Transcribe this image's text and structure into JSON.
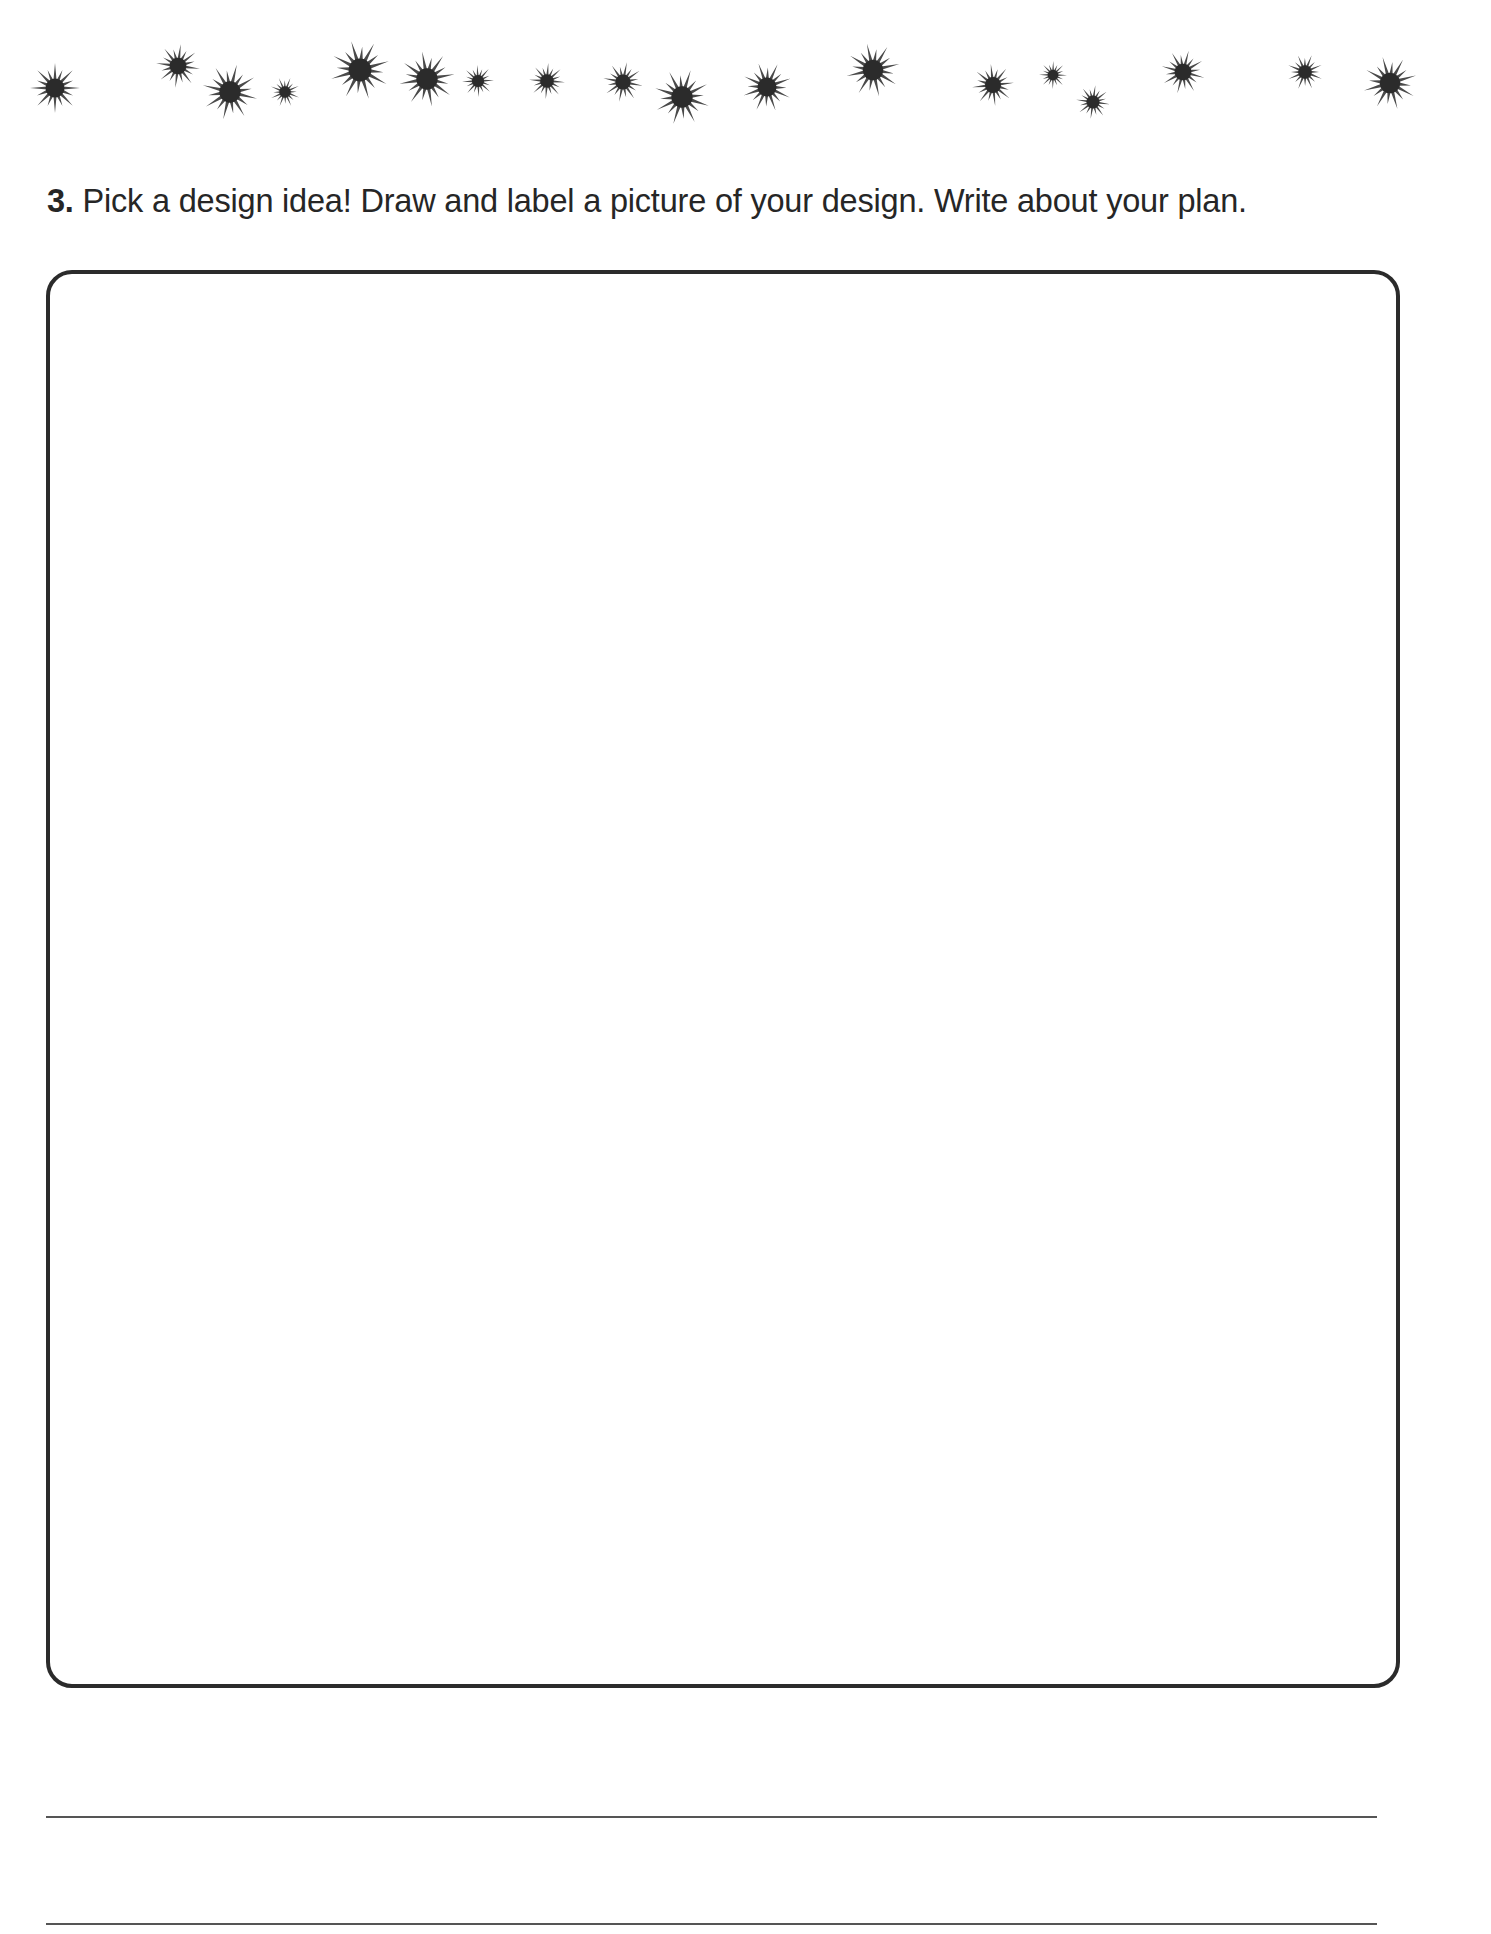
{
  "decoration": {
    "icon": "starburst-icon",
    "color": "#2b2b2b",
    "stars": [
      {
        "x": 55,
        "y": 88,
        "r": 25
      },
      {
        "x": 178,
        "y": 66,
        "r": 22
      },
      {
        "x": 230,
        "y": 92,
        "r": 28
      },
      {
        "x": 285,
        "y": 92,
        "r": 15
      },
      {
        "x": 360,
        "y": 70,
        "r": 30
      },
      {
        "x": 427,
        "y": 79,
        "r": 28
      },
      {
        "x": 478,
        "y": 81,
        "r": 16
      },
      {
        "x": 547,
        "y": 81,
        "r": 18
      },
      {
        "x": 623,
        "y": 82,
        "r": 20
      },
      {
        "x": 682,
        "y": 97,
        "r": 28
      },
      {
        "x": 767,
        "y": 87,
        "r": 25
      },
      {
        "x": 873,
        "y": 70,
        "r": 27
      },
      {
        "x": 993,
        "y": 85,
        "r": 21
      },
      {
        "x": 1053,
        "y": 75,
        "r": 14
      },
      {
        "x": 1093,
        "y": 102,
        "r": 17
      },
      {
        "x": 1183,
        "y": 72,
        "r": 22
      },
      {
        "x": 1305,
        "y": 72,
        "r": 18
      },
      {
        "x": 1390,
        "y": 83,
        "r": 27
      }
    ]
  },
  "question": {
    "number": "3.",
    "text": "Pick a design idea! Draw and label a picture of your design. Write about your plan."
  },
  "drawing_area": {
    "label": "Drawing box"
  },
  "writing_lines": {
    "count": 2
  }
}
